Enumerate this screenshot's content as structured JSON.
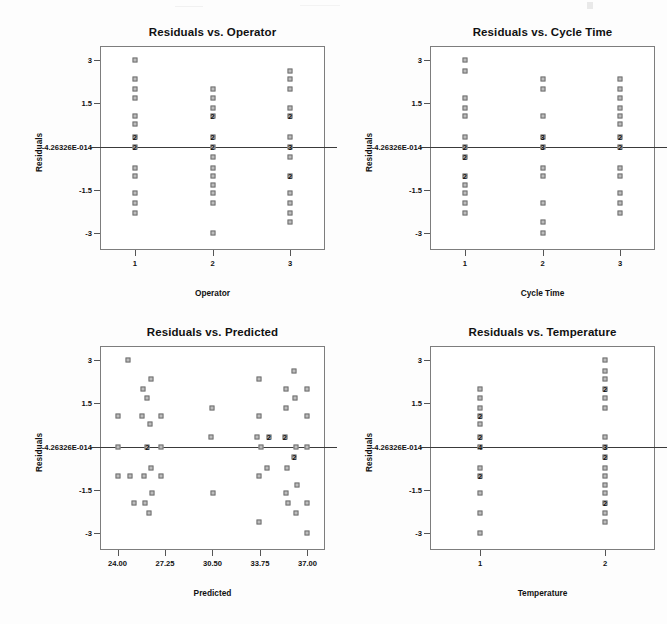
{
  "page": {
    "background_color": "#fdfdfd",
    "marker_fill": "#bdbdbd",
    "marker_stroke": "#6f6f6f",
    "frame_color": "#7d7d7d",
    "zero_line_color": "#3a3a3a",
    "zero_label": "-4.26326E-014"
  },
  "chart_data": [
    {
      "id": "residuals-vs-operator",
      "type": "scatter",
      "title": "Residuals vs. Operator",
      "xlabel": "Operator",
      "ylabel": "Residuals",
      "xlim": [
        0.55,
        3.45
      ],
      "ylim": [
        -3.6,
        3.5
      ],
      "grid": false,
      "legend": false,
      "xticks": [
        1,
        2,
        3
      ],
      "xticklabels": [
        "1",
        "2",
        "3"
      ],
      "yticks": [
        3,
        1.5,
        0,
        -1.5,
        -3
      ],
      "yticklabels": [
        "3",
        "1.5",
        "-4.26326E-014",
        "-1.5",
        "-3"
      ],
      "zero_reference_line": 0,
      "points": [
        {
          "x": 1,
          "y": 3.0,
          "n": 1
        },
        {
          "x": 1,
          "y": 2.35,
          "n": 1
        },
        {
          "x": 1,
          "y": 2.0,
          "n": 1
        },
        {
          "x": 1,
          "y": 1.68,
          "n": 1
        },
        {
          "x": 1,
          "y": 1.07,
          "n": 1
        },
        {
          "x": 1,
          "y": 0.78,
          "n": 1
        },
        {
          "x": 1,
          "y": 0.32,
          "n": 2
        },
        {
          "x": 1,
          "y": 0.0,
          "n": 2
        },
        {
          "x": 1,
          "y": -0.74,
          "n": 1
        },
        {
          "x": 1,
          "y": -1.03,
          "n": 1
        },
        {
          "x": 1,
          "y": -1.62,
          "n": 1
        },
        {
          "x": 1,
          "y": -1.95,
          "n": 1
        },
        {
          "x": 1,
          "y": -2.3,
          "n": 1
        },
        {
          "x": 2,
          "y": 2.0,
          "n": 1
        },
        {
          "x": 2,
          "y": 1.68,
          "n": 1
        },
        {
          "x": 2,
          "y": 1.35,
          "n": 1
        },
        {
          "x": 2,
          "y": 1.07,
          "n": 2
        },
        {
          "x": 2,
          "y": 0.32,
          "n": 2
        },
        {
          "x": 2,
          "y": 0.0,
          "n": 2
        },
        {
          "x": 2,
          "y": -0.38,
          "n": 1
        },
        {
          "x": 2,
          "y": -0.74,
          "n": 1
        },
        {
          "x": 2,
          "y": -1.03,
          "n": 1
        },
        {
          "x": 2,
          "y": -1.35,
          "n": 1
        },
        {
          "x": 2,
          "y": -1.62,
          "n": 1
        },
        {
          "x": 2,
          "y": -1.95,
          "n": 1
        },
        {
          "x": 2,
          "y": -3.0,
          "n": 1
        },
        {
          "x": 3,
          "y": 2.62,
          "n": 1
        },
        {
          "x": 3,
          "y": 2.35,
          "n": 1
        },
        {
          "x": 3,
          "y": 2.0,
          "n": 1
        },
        {
          "x": 3,
          "y": 1.35,
          "n": 1
        },
        {
          "x": 3,
          "y": 1.07,
          "n": 2
        },
        {
          "x": 3,
          "y": 0.32,
          "n": 1
        },
        {
          "x": 3,
          "y": 0.0,
          "n": 3
        },
        {
          "x": 3,
          "y": -0.38,
          "n": 1
        },
        {
          "x": 3,
          "y": -1.03,
          "n": 2
        },
        {
          "x": 3,
          "y": -1.62,
          "n": 1
        },
        {
          "x": 3,
          "y": -1.95,
          "n": 1
        },
        {
          "x": 3,
          "y": -2.3,
          "n": 1
        },
        {
          "x": 3,
          "y": -2.62,
          "n": 1
        }
      ]
    },
    {
      "id": "residuals-vs-cycle-time",
      "type": "scatter",
      "title": "Residuals vs. Cycle Time",
      "xlabel": "Cycle Time",
      "ylabel": "Residuals",
      "xlim": [
        0.55,
        3.45
      ],
      "ylim": [
        -3.6,
        3.5
      ],
      "grid": false,
      "legend": false,
      "xticks": [
        1,
        2,
        3
      ],
      "xticklabels": [
        "1",
        "2",
        "3"
      ],
      "yticks": [
        3,
        1.5,
        0,
        -1.5,
        -3
      ],
      "yticklabels": [
        "3",
        "1.5",
        "-4.26326E-014",
        "-1.5",
        "-3"
      ],
      "zero_reference_line": 0,
      "points": [
        {
          "x": 1,
          "y": 3.0,
          "n": 1
        },
        {
          "x": 1,
          "y": 2.62,
          "n": 1
        },
        {
          "x": 1,
          "y": 1.68,
          "n": 1
        },
        {
          "x": 1,
          "y": 1.35,
          "n": 1
        },
        {
          "x": 1,
          "y": 1.07,
          "n": 1
        },
        {
          "x": 1,
          "y": 0.32,
          "n": 1
        },
        {
          "x": 1,
          "y": 0.0,
          "n": 2
        },
        {
          "x": 1,
          "y": -0.38,
          "n": 2
        },
        {
          "x": 1,
          "y": -1.03,
          "n": 2
        },
        {
          "x": 1,
          "y": -1.35,
          "n": 1
        },
        {
          "x": 1,
          "y": -1.62,
          "n": 1
        },
        {
          "x": 1,
          "y": -1.95,
          "n": 1
        },
        {
          "x": 1,
          "y": -2.3,
          "n": 1
        },
        {
          "x": 2,
          "y": 2.35,
          "n": 1
        },
        {
          "x": 2,
          "y": 2.0,
          "n": 1
        },
        {
          "x": 2,
          "y": 1.07,
          "n": 1
        },
        {
          "x": 2,
          "y": 0.32,
          "n": 3
        },
        {
          "x": 2,
          "y": 0.0,
          "n": 3
        },
        {
          "x": 2,
          "y": -0.74,
          "n": 1
        },
        {
          "x": 2,
          "y": -1.03,
          "n": 1
        },
        {
          "x": 2,
          "y": -1.95,
          "n": 1
        },
        {
          "x": 2,
          "y": -2.62,
          "n": 1
        },
        {
          "x": 2,
          "y": -3.0,
          "n": 1
        },
        {
          "x": 3,
          "y": 2.35,
          "n": 1
        },
        {
          "x": 3,
          "y": 2.0,
          "n": 1
        },
        {
          "x": 3,
          "y": 1.68,
          "n": 1
        },
        {
          "x": 3,
          "y": 1.35,
          "n": 1
        },
        {
          "x": 3,
          "y": 1.07,
          "n": 1
        },
        {
          "x": 3,
          "y": 0.78,
          "n": 1
        },
        {
          "x": 3,
          "y": 0.32,
          "n": 2
        },
        {
          "x": 3,
          "y": 0.0,
          "n": 2
        },
        {
          "x": 3,
          "y": -0.74,
          "n": 1
        },
        {
          "x": 3,
          "y": -1.03,
          "n": 1
        },
        {
          "x": 3,
          "y": -1.62,
          "n": 1
        },
        {
          "x": 3,
          "y": -1.95,
          "n": 1
        },
        {
          "x": 3,
          "y": -2.3,
          "n": 1
        }
      ]
    },
    {
      "id": "residuals-vs-predicted",
      "type": "scatter",
      "title": "Residuals vs. Predicted",
      "xlabel": "Predicted",
      "ylabel": "Residuals",
      "xlim": [
        22.8,
        38.2
      ],
      "ylim": [
        -3.6,
        3.5
      ],
      "grid": false,
      "legend": false,
      "xticks": [
        24.0,
        27.25,
        30.5,
        33.75,
        37.0
      ],
      "xticklabels": [
        "24.00",
        "27.25",
        "30.50",
        "33.75",
        "37.00"
      ],
      "yticks": [
        3,
        1.5,
        0,
        -1.5,
        -3
      ],
      "yticklabels": [
        "3",
        "1.5",
        "-4.26326E-014",
        "-1.5",
        "-3"
      ],
      "zero_reference_line": 0,
      "points": [
        {
          "x": 24.0,
          "y": 1.07,
          "n": 1
        },
        {
          "x": 24.0,
          "y": 0.0,
          "n": 1
        },
        {
          "x": 24.0,
          "y": -1.03,
          "n": 1
        },
        {
          "x": 24.75,
          "y": 3.0,
          "n": 1
        },
        {
          "x": 24.85,
          "y": -1.03,
          "n": 1
        },
        {
          "x": 25.1,
          "y": -1.95,
          "n": 1
        },
        {
          "x": 25.75,
          "y": 2.0,
          "n": 1
        },
        {
          "x": 25.7,
          "y": 1.07,
          "n": 1
        },
        {
          "x": 25.8,
          "y": -1.03,
          "n": 1
        },
        {
          "x": 25.85,
          "y": -1.95,
          "n": 1
        },
        {
          "x": 26.05,
          "y": 1.68,
          "n": 1
        },
        {
          "x": 26.05,
          "y": 0.0,
          "n": 2
        },
        {
          "x": 26.15,
          "y": -2.3,
          "n": 1
        },
        {
          "x": 26.3,
          "y": 2.35,
          "n": 1
        },
        {
          "x": 26.25,
          "y": 0.78,
          "n": 1
        },
        {
          "x": 26.3,
          "y": -0.74,
          "n": 1
        },
        {
          "x": 26.35,
          "y": -1.62,
          "n": 1
        },
        {
          "x": 26.95,
          "y": 1.07,
          "n": 1
        },
        {
          "x": 26.95,
          "y": 0.0,
          "n": 1
        },
        {
          "x": 27.0,
          "y": -1.03,
          "n": 1
        },
        {
          "x": 30.45,
          "y": 1.35,
          "n": 1
        },
        {
          "x": 30.4,
          "y": 0.32,
          "n": 1
        },
        {
          "x": 30.5,
          "y": -1.62,
          "n": 1
        },
        {
          "x": 33.7,
          "y": 2.35,
          "n": 1
        },
        {
          "x": 33.7,
          "y": 1.07,
          "n": 1
        },
        {
          "x": 33.55,
          "y": 0.32,
          "n": 1
        },
        {
          "x": 33.8,
          "y": 0.0,
          "n": 1
        },
        {
          "x": 33.7,
          "y": -1.03,
          "n": 1
        },
        {
          "x": 33.65,
          "y": -2.62,
          "n": 1
        },
        {
          "x": 34.35,
          "y": 0.32,
          "n": 2
        },
        {
          "x": 34.2,
          "y": -0.74,
          "n": 1
        },
        {
          "x": 35.5,
          "y": 2.0,
          "n": 1
        },
        {
          "x": 35.55,
          "y": 1.35,
          "n": 1
        },
        {
          "x": 35.45,
          "y": 0.32,
          "n": 2
        },
        {
          "x": 35.6,
          "y": -0.74,
          "n": 1
        },
        {
          "x": 35.5,
          "y": -1.62,
          "n": 1
        },
        {
          "x": 35.65,
          "y": -1.95,
          "n": 1
        },
        {
          "x": 36.1,
          "y": 2.62,
          "n": 1
        },
        {
          "x": 36.15,
          "y": 1.68,
          "n": 1
        },
        {
          "x": 36.2,
          "y": 0.0,
          "n": 1
        },
        {
          "x": 36.1,
          "y": -0.38,
          "n": 2
        },
        {
          "x": 36.25,
          "y": -1.35,
          "n": 1
        },
        {
          "x": 36.2,
          "y": -2.3,
          "n": 1
        },
        {
          "x": 37.0,
          "y": 2.0,
          "n": 1
        },
        {
          "x": 37.0,
          "y": 1.07,
          "n": 1
        },
        {
          "x": 37.0,
          "y": 0.0,
          "n": 1
        },
        {
          "x": 37.0,
          "y": -1.95,
          "n": 1
        },
        {
          "x": 37.0,
          "y": -3.0,
          "n": 1
        }
      ]
    },
    {
      "id": "residuals-vs-temperature",
      "type": "scatter",
      "title": "Residuals vs. Temperature",
      "xlabel": "Temperature",
      "ylabel": "Residuals",
      "xlim": [
        0.6,
        2.4
      ],
      "ylim": [
        -3.6,
        3.5
      ],
      "grid": false,
      "legend": false,
      "xticks": [
        1,
        2
      ],
      "xticklabels": [
        "1",
        "2"
      ],
      "yticks": [
        3,
        1.5,
        0,
        -1.5,
        -3
      ],
      "yticklabels": [
        "3",
        "1.5",
        "-4.26326E-014",
        "-1.5",
        "-3"
      ],
      "zero_reference_line": 0,
      "points": [
        {
          "x": 1,
          "y": 2.0,
          "n": 1
        },
        {
          "x": 1,
          "y": 1.68,
          "n": 1
        },
        {
          "x": 1,
          "y": 1.35,
          "n": 1
        },
        {
          "x": 1,
          "y": 1.07,
          "n": 2
        },
        {
          "x": 1,
          "y": 0.78,
          "n": 1
        },
        {
          "x": 1,
          "y": 0.32,
          "n": 2
        },
        {
          "x": 1,
          "y": 0.0,
          "n": 4
        },
        {
          "x": 1,
          "y": -0.74,
          "n": 1
        },
        {
          "x": 1,
          "y": -1.03,
          "n": 2
        },
        {
          "x": 1,
          "y": -1.62,
          "n": 1
        },
        {
          "x": 1,
          "y": -2.3,
          "n": 1
        },
        {
          "x": 1,
          "y": -3.0,
          "n": 1
        },
        {
          "x": 2,
          "y": 3.0,
          "n": 1
        },
        {
          "x": 2,
          "y": 2.62,
          "n": 1
        },
        {
          "x": 2,
          "y": 2.35,
          "n": 1
        },
        {
          "x": 2,
          "y": 2.0,
          "n": 2
        },
        {
          "x": 2,
          "y": 1.68,
          "n": 1
        },
        {
          "x": 2,
          "y": 1.35,
          "n": 1
        },
        {
          "x": 2,
          "y": 0.32,
          "n": 1
        },
        {
          "x": 2,
          "y": 0.0,
          "n": 3
        },
        {
          "x": 2,
          "y": -0.38,
          "n": 2
        },
        {
          "x": 2,
          "y": -0.74,
          "n": 1
        },
        {
          "x": 2,
          "y": -1.03,
          "n": 1
        },
        {
          "x": 2,
          "y": -1.35,
          "n": 1
        },
        {
          "x": 2,
          "y": -1.62,
          "n": 1
        },
        {
          "x": 2,
          "y": -1.95,
          "n": 2
        },
        {
          "x": 2,
          "y": -2.3,
          "n": 1
        },
        {
          "x": 2,
          "y": -2.62,
          "n": 1
        }
      ]
    }
  ],
  "layout": {
    "panels": [
      {
        "id": "residuals-vs-operator",
        "left": 30,
        "top": 24,
        "plot_x": 70,
        "plot_y": 22,
        "plot_w": 225,
        "plot_h": 204
      },
      {
        "id": "residuals-vs-cycle-time",
        "left": 360,
        "top": 24,
        "plot_x": 70,
        "plot_y": 22,
        "plot_w": 225,
        "plot_h": 204
      },
      {
        "id": "residuals-vs-predicted",
        "left": 30,
        "top": 324,
        "plot_x": 70,
        "plot_y": 22,
        "plot_w": 225,
        "plot_h": 204
      },
      {
        "id": "residuals-vs-temperature",
        "left": 360,
        "top": 324,
        "plot_x": 70,
        "plot_y": 22,
        "plot_w": 225,
        "plot_h": 204
      }
    ]
  }
}
